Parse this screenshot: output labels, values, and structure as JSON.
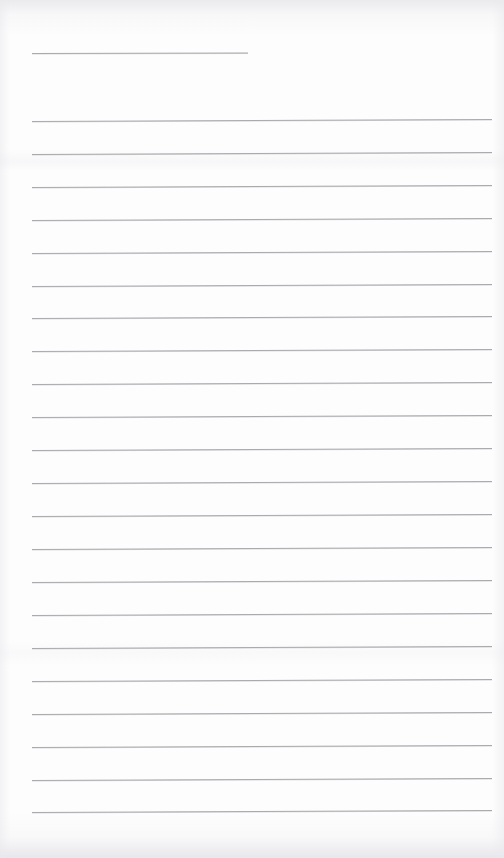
{
  "document": {
    "kind": "scanned-lined-notepaper",
    "title": "",
    "page_width": 504,
    "page_height": 858,
    "paper_color": "#fdfdfd",
    "rule_color": "#a9a9ae",
    "rule_thickness_px": 1,
    "left_margin_px": 32,
    "right_margin_px": 492,
    "line_spacing_px": 33,
    "body_text": "",
    "is_blank": true,
    "notes_count": 0
  },
  "rules": [
    {
      "id": "title-rule",
      "y": 53,
      "x1": 32,
      "x2": 248,
      "skew_deg": -0.15,
      "kind": "short"
    },
    {
      "id": "rule-01",
      "y": 121,
      "x1": 32,
      "x2": 492,
      "skew_deg": -0.25,
      "kind": "full"
    },
    {
      "id": "rule-02",
      "y": 154,
      "x1": 32,
      "x2": 492,
      "skew_deg": -0.25,
      "kind": "full"
    },
    {
      "id": "rule-03",
      "y": 187,
      "x1": 32,
      "x2": 492,
      "skew_deg": -0.25,
      "kind": "full"
    },
    {
      "id": "rule-04",
      "y": 220,
      "x1": 32,
      "x2": 492,
      "skew_deg": -0.25,
      "kind": "full"
    },
    {
      "id": "rule-05",
      "y": 253,
      "x1": 32,
      "x2": 492,
      "skew_deg": -0.25,
      "kind": "full"
    },
    {
      "id": "rule-06",
      "y": 286,
      "x1": 32,
      "x2": 492,
      "skew_deg": -0.25,
      "kind": "full"
    },
    {
      "id": "rule-07",
      "y": 318,
      "x1": 32,
      "x2": 492,
      "skew_deg": -0.25,
      "kind": "full"
    },
    {
      "id": "rule-08",
      "y": 351,
      "x1": 32,
      "x2": 492,
      "skew_deg": -0.25,
      "kind": "full"
    },
    {
      "id": "rule-09",
      "y": 384,
      "x1": 32,
      "x2": 492,
      "skew_deg": -0.25,
      "kind": "full"
    },
    {
      "id": "rule-10",
      "y": 417,
      "x1": 32,
      "x2": 492,
      "skew_deg": -0.25,
      "kind": "full"
    },
    {
      "id": "rule-11",
      "y": 450,
      "x1": 32,
      "x2": 492,
      "skew_deg": -0.25,
      "kind": "full"
    },
    {
      "id": "rule-12",
      "y": 483,
      "x1": 32,
      "x2": 492,
      "skew_deg": -0.25,
      "kind": "full"
    },
    {
      "id": "rule-13",
      "y": 516,
      "x1": 32,
      "x2": 492,
      "skew_deg": -0.25,
      "kind": "full"
    },
    {
      "id": "rule-14",
      "y": 549,
      "x1": 32,
      "x2": 492,
      "skew_deg": -0.25,
      "kind": "full"
    },
    {
      "id": "rule-15",
      "y": 582,
      "x1": 32,
      "x2": 492,
      "skew_deg": -0.25,
      "kind": "full"
    },
    {
      "id": "rule-16",
      "y": 615,
      "x1": 32,
      "x2": 492,
      "skew_deg": -0.25,
      "kind": "full"
    },
    {
      "id": "rule-17",
      "y": 648,
      "x1": 32,
      "x2": 492,
      "skew_deg": -0.25,
      "kind": "full"
    },
    {
      "id": "rule-18",
      "y": 681,
      "x1": 32,
      "x2": 492,
      "skew_deg": -0.25,
      "kind": "full"
    },
    {
      "id": "rule-19",
      "y": 714,
      "x1": 32,
      "x2": 492,
      "skew_deg": -0.25,
      "kind": "full"
    },
    {
      "id": "rule-20",
      "y": 747,
      "x1": 32,
      "x2": 492,
      "skew_deg": -0.25,
      "kind": "full"
    },
    {
      "id": "rule-21",
      "y": 780,
      "x1": 32,
      "x2": 492,
      "skew_deg": -0.25,
      "kind": "full"
    },
    {
      "id": "rule-22",
      "y": 812,
      "x1": 32,
      "x2": 492,
      "skew_deg": -0.25,
      "kind": "full"
    }
  ]
}
